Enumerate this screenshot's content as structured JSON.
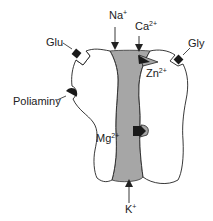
{
  "diagram": {
    "colors": {
      "outline": "#222222",
      "channel_fill": "#a6a6a6",
      "site_fill": "#1a1a1a",
      "background": "#ffffff"
    },
    "labels": {
      "na": {
        "base": "Na",
        "sup": "+"
      },
      "ca": {
        "base": "Ca",
        "sup": "2+"
      },
      "glu": {
        "base": "Glu"
      },
      "gly": {
        "base": "Gly"
      },
      "zn": {
        "base": "Zn",
        "sup": "2+"
      },
      "poliaminy": {
        "base": "Poliaminy"
      },
      "mg": {
        "base": "Mg",
        "sup": "2+"
      },
      "k": {
        "base": "K",
        "sup": "+"
      }
    },
    "flows": [
      {
        "ion": "Na+",
        "direction": "inward"
      },
      {
        "ion": "Ca2+",
        "direction": "inward"
      },
      {
        "ion": "K+",
        "direction": "outward"
      }
    ],
    "binding_sites": [
      "Glu",
      "Gly",
      "Zn2+",
      "Poliaminy",
      "Mg2+"
    ]
  }
}
